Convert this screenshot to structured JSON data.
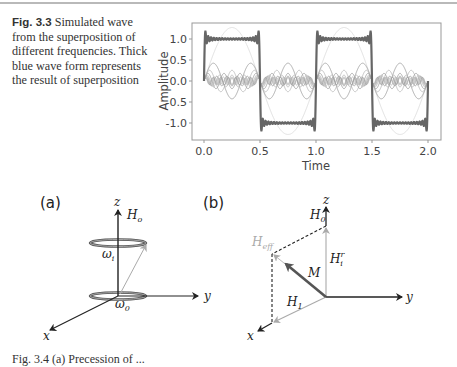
{
  "figure_3_3": {
    "label": "Fig. 3.3",
    "caption": "Simulated wave from the superposition of different frequencies. Thick blue wave form represents the result of superposition"
  },
  "chart_data": {
    "type": "line",
    "title": "",
    "xlabel": "Time",
    "ylabel": "Amplitude",
    "xlim": [
      -0.1,
      2.05
    ],
    "ylim": [
      -1.35,
      1.35
    ],
    "x_ticks": [
      "0.0",
      "0.5",
      "1.0",
      "1.5",
      "2.0"
    ],
    "y_ticks": [
      "1.0",
      "0.5",
      "0.0",
      "-0.5",
      "-1.0"
    ],
    "grid": false,
    "legend": null,
    "series": [
      {
        "name": "superposition (sum)",
        "style": "thick",
        "harmonics": [
          1,
          3,
          5,
          7,
          9,
          11,
          13,
          15,
          17,
          19,
          21,
          23,
          25,
          27,
          29,
          31,
          33,
          35,
          37,
          39
        ],
        "amplitude": 1.0,
        "period": 1.0
      },
      {
        "name": "harmonic n=1",
        "style": "thin",
        "amplitude": 1.27
      },
      {
        "name": "harmonic n=3",
        "style": "thin",
        "amplitude": 0.42
      },
      {
        "name": "harmonic n=5",
        "style": "thin",
        "amplitude": 0.25
      },
      {
        "name": "harmonic n=7",
        "style": "thin",
        "amplitude": 0.18
      },
      {
        "name": "harmonic n=9",
        "style": "thin",
        "amplitude": 0.14
      },
      {
        "name": "harmonics n>=11",
        "style": "thin",
        "amplitude": 0.12
      }
    ]
  },
  "diagram_a": {
    "panel_label": "(a)",
    "axes": {
      "z": "z",
      "y": "y",
      "x": "x"
    },
    "field_label": "H",
    "field_sub": "o",
    "omega_top": "ω",
    "omega_top_sub": "i",
    "omega_bottom": "ω",
    "omega_bottom_sub": "0"
  },
  "diagram_b": {
    "panel_label": "(b)",
    "axes": {
      "z": "z",
      "y": "y",
      "x": "x"
    },
    "h0": "H",
    "h0_sub": "0",
    "heff": "H",
    "heff_sub": "eff",
    "m": "M",
    "hir": "H",
    "hir_sub": "i",
    "hir_sup": "r",
    "h1": "H",
    "h1_sub": "1"
  },
  "bottom_caption_partial": "Fig. 3.4 (a) Precession of ..."
}
